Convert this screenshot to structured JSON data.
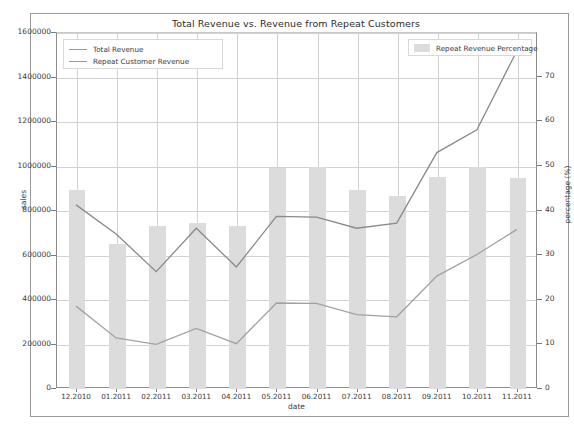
{
  "chart_data": {
    "type": "bar",
    "title": "Total Revenue vs. Revenue from Repeat Customers",
    "xlabel": "date",
    "ylabel": "sales",
    "ylabel_right": "percentage (%)",
    "grid": true,
    "legend_position": "upper-left and upper-right",
    "categories": [
      "12.2010",
      "01.2011",
      "02.2011",
      "03.2011",
      "04.2011",
      "05.2011",
      "06.2011",
      "07.2011",
      "08.2011",
      "09.2011",
      "10.2011",
      "11.2011"
    ],
    "ylim": [
      0,
      1600000
    ],
    "yticks": [
      0,
      200000,
      400000,
      600000,
      800000,
      1000000,
      1200000,
      1400000,
      1600000
    ],
    "ytick_labels": [
      "0",
      "200000",
      "400000",
      "600000",
      "800000",
      "1000000",
      "1200000",
      "1400000",
      "1600000"
    ],
    "ylim_right": [
      0,
      79.8
    ],
    "yticks_right": [
      0,
      10,
      20,
      30,
      40,
      50,
      60,
      70
    ],
    "ytick_labels_right": [
      "0",
      "10",
      "20",
      "30",
      "40",
      "50",
      "60",
      "70"
    ],
    "bars": {
      "name": "Repeat Revenue Percentage",
      "axis": "right",
      "color": "#dcdcdc",
      "values": [
        44.7,
        32.5,
        36.5,
        37.2,
        36.5,
        49.5,
        49.7,
        44.5,
        43.2,
        47.5,
        49.7,
        47.4
      ]
    },
    "series": [
      {
        "name": "Total Revenue",
        "axis": "left",
        "color": "#8a8a8a",
        "values": [
          823000,
          692000,
          523000,
          718000,
          544000,
          771000,
          768000,
          718000,
          741000,
          1058000,
          1160000,
          1516000
        ]
      },
      {
        "name": "Repeat Customer Revenue",
        "axis": "left",
        "color": "#a2a2a2",
        "values": [
          368000,
          225000,
          196000,
          268000,
          199000,
          382000,
          380000,
          330000,
          320000,
          503000,
          600000,
          713000
        ]
      }
    ]
  },
  "legend_left": {
    "items": [
      {
        "label": "Total Revenue",
        "marker": "line"
      },
      {
        "label": "Repeat Customer Revenue",
        "marker": "line"
      }
    ]
  },
  "legend_right": {
    "items": [
      {
        "label": "Repeat Revenue Percentage",
        "marker": "swatch"
      }
    ]
  }
}
